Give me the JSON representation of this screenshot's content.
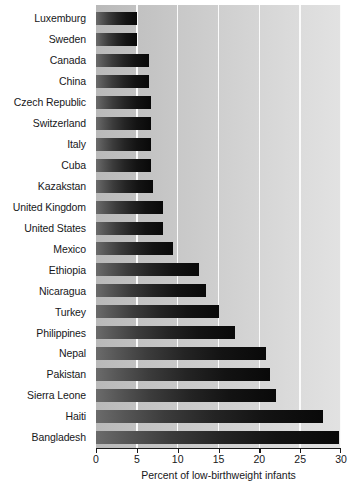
{
  "chart_data": {
    "type": "bar",
    "orientation": "horizontal",
    "title": "",
    "xlabel": "Percent of low-birthweight infants",
    "ylabel": "",
    "xlim": [
      0,
      30
    ],
    "xticks": [
      0,
      5,
      10,
      15,
      20,
      25,
      30
    ],
    "xtick_labels": [
      "0",
      "5",
      "10",
      "15",
      "20",
      "25",
      "30"
    ],
    "grid": "vertical-white-gridlines",
    "legend": "none",
    "categories": [
      "Luxemburg",
      "Sweden",
      "Canada",
      "China",
      "Czech Republic",
      "Switzerland",
      "Italy",
      "Cuba",
      "Kazakstan",
      "United Kingdom",
      "United States",
      "Mexico",
      "Ethiopia",
      "Nicaragua",
      "Turkey",
      "Philippines",
      "Nepal",
      "Pakistan",
      "Sierra Leone",
      "Haiti",
      "Bangladesh"
    ],
    "values": [
      5.0,
      5.0,
      6.5,
      6.5,
      6.7,
      6.7,
      6.7,
      6.7,
      7.0,
      8.2,
      8.2,
      9.4,
      12.6,
      13.5,
      15.0,
      17.0,
      20.8,
      21.3,
      22.0,
      27.8,
      29.8
    ],
    "colors": {
      "bar_gradient_start": "#6b6b6b",
      "bar_gradient_end": "#090909",
      "plot_background_left": "#b9b9b9",
      "plot_background_right": "#e2e2e2",
      "gridline": "#fbfbfb",
      "axis": "#1a1a1a",
      "text": "#17171a"
    }
  }
}
